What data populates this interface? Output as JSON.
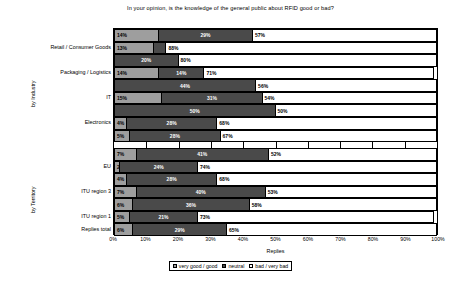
{
  "chart_data": {
    "type": "bar",
    "subtype": "horizontal-stacked-grouped",
    "title": "In your opinion, is the knowledge of the general public about RFID good or bad?",
    "xlabel": "Replies",
    "ylabel": "",
    "xlim": [
      0,
      100
    ],
    "xunit": "%",
    "grid": true,
    "legend_position": "bottom",
    "xticks": [
      "0%",
      "10%",
      "20%",
      "30%",
      "40%",
      "50%",
      "60%",
      "70%",
      "80%",
      "90%",
      "100%"
    ],
    "xtick_values": [
      0,
      10,
      20,
      30,
      40,
      50,
      60,
      70,
      80,
      90,
      100
    ],
    "legend": [
      {
        "label": "very good / good",
        "color": "#9e9e9e",
        "key": "good"
      },
      {
        "label": "neutral",
        "color": "#4a4a4a",
        "key": "neutral"
      },
      {
        "label": "bad / very bad",
        "color": "#ffffff",
        "key": "bad"
      }
    ],
    "series": [
      {
        "name": "very good / good",
        "key": "good",
        "color": "#9e9e9e"
      },
      {
        "name": "neutral",
        "key": "neutral",
        "color": "#4a4a4a"
      },
      {
        "name": "bad / very bad",
        "key": "bad",
        "color": "#ffffff"
      }
    ],
    "groups": [
      {
        "name": "by Industry",
        "label": "by Industry",
        "rows": [
          {
            "category": "",
            "good": 14,
            "neutral": 29,
            "bad": 57,
            "labels": {
              "good": "14%",
              "neutral": "29%",
              "bad": "57%"
            }
          },
          {
            "category": "Retail / Consumer Goods",
            "good": 13,
            "neutral": 4,
            "bad": 88,
            "labels": {
              "good": "13%",
              "neutral": "",
              "bad": "88%"
            }
          },
          {
            "category": "",
            "good": 0,
            "neutral": 20,
            "bad": 80,
            "labels": {
              "good": "",
              "neutral": "20%",
              "bad": "80%"
            }
          },
          {
            "category": "Packaging / Logistics",
            "good": 14,
            "neutral": 14,
            "bad": 71,
            "labels": {
              "good": "14%",
              "neutral": "14%",
              "bad": "71%"
            }
          },
          {
            "category": "",
            "good": 0,
            "neutral": 44,
            "bad": 56,
            "labels": {
              "good": "",
              "neutral": "44%",
              "bad": "56%"
            }
          },
          {
            "category": "IT",
            "good": 15,
            "neutral": 31,
            "bad": 54,
            "labels": {
              "good": "15%",
              "neutral": "31%",
              "bad": "54%"
            }
          },
          {
            "category": "",
            "good": 0,
            "neutral": 50,
            "bad": 50,
            "labels": {
              "good": "",
              "neutral": "50%",
              "bad": "50%"
            }
          },
          {
            "category": "Electronics",
            "good": 4,
            "neutral": 28,
            "bad": 68,
            "labels": {
              "good": "4%",
              "neutral": "28%",
              "bad": "68%"
            }
          },
          {
            "category": "",
            "good": 5,
            "neutral": 28,
            "bad": 67,
            "labels": {
              "good": "5%",
              "neutral": "28%",
              "bad": "67%"
            }
          }
        ]
      },
      {
        "name": "by Territory",
        "label": "by Territory",
        "rows": [
          {
            "category": "",
            "good": 7,
            "neutral": 41,
            "bad": 52,
            "labels": {
              "good": "7%",
              "neutral": "41%",
              "bad": "52%"
            }
          },
          {
            "category": "EU",
            "good": 2,
            "neutral": 24,
            "bad": 74,
            "labels": {
              "good": "2%",
              "neutral": "24%",
              "bad": "74%"
            }
          },
          {
            "category": "",
            "good": 4,
            "neutral": 28,
            "bad": 68,
            "labels": {
              "good": "4%",
              "neutral": "28%",
              "bad": "68%"
            }
          },
          {
            "category": "ITU region 3",
            "good": 7,
            "neutral": 40,
            "bad": 53,
            "labels": {
              "good": "7%",
              "neutral": "40%",
              "bad": "53%"
            }
          },
          {
            "category": "",
            "good": 6,
            "neutral": 36,
            "bad": 58,
            "labels": {
              "good": "6%",
              "neutral": "36%",
              "bad": "58%"
            }
          },
          {
            "category": "ITU region 1",
            "good": 5,
            "neutral": 21,
            "bad": 73,
            "labels": {
              "good": "5%",
              "neutral": "21%",
              "bad": "73%"
            }
          },
          {
            "category": "Replies total",
            "good": 6,
            "neutral": 29,
            "bad": 65,
            "labels": {
              "good": "6%",
              "neutral": "29%",
              "bad": "65%"
            }
          }
        ]
      }
    ]
  },
  "footer": {
    "text": ""
  }
}
